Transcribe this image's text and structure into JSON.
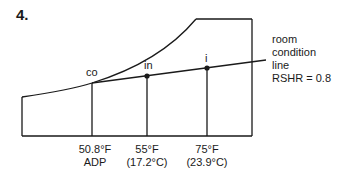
{
  "problem_number": "4.",
  "points": {
    "co": "co",
    "in": "in",
    "i": "i"
  },
  "annotation": {
    "line1": "room",
    "line2": "condition",
    "line3": "line",
    "line4": "RSHR = 0.8"
  },
  "axis_labels": [
    {
      "top": "50.8°F",
      "bottom": "ADP"
    },
    {
      "top": "55°F",
      "bottom": "(17.2°C)"
    },
    {
      "top": "75°F",
      "bottom": "(23.9°C)"
    }
  ],
  "colors": {
    "line": "#1a1a1a",
    "background": "#ffffff"
  }
}
